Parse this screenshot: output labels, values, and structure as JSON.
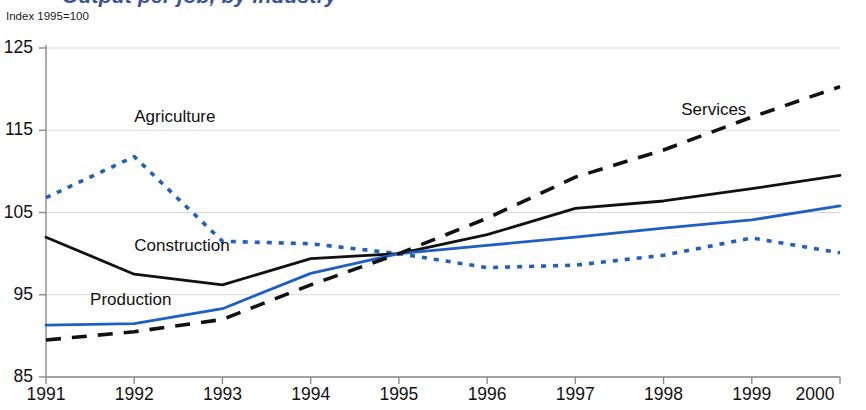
{
  "header": {
    "title": "Output per job, by industry",
    "subtitle": "Index 1995=100"
  },
  "colors": {
    "blue": "#1f5fc0",
    "black": "#111111",
    "grid": "#d9d9d9",
    "axis": "#8a8a8a",
    "title": "#3a52a0"
  },
  "chart_data": {
    "type": "line",
    "title": "Output per job, by industry",
    "subtitle": "Index 1995=100",
    "xlabel": "",
    "ylabel": "Index 1995=100",
    "x": [
      1991,
      1992,
      1993,
      1994,
      1995,
      1996,
      1997,
      1998,
      1999,
      2000
    ],
    "xlim": [
      1991,
      2000
    ],
    "ylim": [
      85,
      125
    ],
    "yticks": [
      85,
      95,
      105,
      115,
      125
    ],
    "xticks": [
      "1991",
      "1992",
      "1993",
      "1994",
      "1995",
      "1996",
      "1997",
      "1998",
      "1999",
      "2000"
    ],
    "grid": true,
    "legend": "inline-annotations",
    "series": [
      {
        "name": "Agriculture",
        "color": "#1f5fc0",
        "style": "dotted",
        "label_x": 1992.0,
        "label_y": 116.5,
        "values": [
          106.8,
          111.8,
          101.5,
          101.2,
          100.0,
          98.3,
          98.6,
          99.8,
          101.9,
          100.1
        ]
      },
      {
        "name": "Construction",
        "color": "#111111",
        "style": "solid",
        "label_x": 1992.0,
        "label_y": 100.8,
        "values": [
          102.0,
          97.5,
          96.2,
          99.4,
          100.0,
          102.3,
          105.5,
          106.4,
          107.9,
          109.5
        ]
      },
      {
        "name": "Production",
        "color": "#1f5fc0",
        "style": "solid",
        "label_x": 1991.5,
        "label_y": 94.3,
        "values": [
          91.3,
          91.5,
          93.3,
          97.6,
          100.0,
          101.0,
          102.0,
          103.1,
          104.1,
          105.8
        ]
      },
      {
        "name": "Services",
        "color": "#111111",
        "style": "dashed",
        "label_x": 1998.2,
        "label_y": 117.4,
        "values": [
          89.5,
          90.5,
          92.0,
          96.2,
          100.0,
          104.3,
          109.3,
          112.6,
          116.6,
          120.3
        ]
      }
    ]
  }
}
